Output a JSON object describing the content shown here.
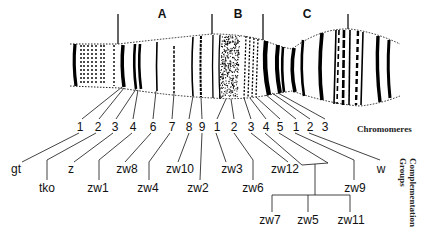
{
  "figure": {
    "regions": [
      {
        "label": "A",
        "x": 162,
        "y": 10
      },
      {
        "label": "B",
        "x": 238,
        "y": 10
      },
      {
        "label": "C",
        "x": 307,
        "y": 10
      }
    ],
    "region_boundaries_x": [
      118,
      212,
      263,
      348
    ],
    "chromomeres_label": "Chromomeres",
    "complementation_label": "Complementation Groups",
    "complementation_label_lines": [
      "Complementation",
      "Groups"
    ],
    "chromomeres": [
      {
        "label": "1",
        "x": 80,
        "region": "A"
      },
      {
        "label": "2",
        "x": 98,
        "region": "A"
      },
      {
        "label": "3",
        "x": 115,
        "region": "A"
      },
      {
        "label": "4",
        "x": 133,
        "region": "A"
      },
      {
        "label": "6",
        "x": 153,
        "region": "A"
      },
      {
        "label": "7",
        "x": 172,
        "region": "A"
      },
      {
        "label": "8",
        "x": 189,
        "region": "A"
      },
      {
        "label": "9",
        "x": 202,
        "region": "A"
      },
      {
        "label": "1",
        "x": 217,
        "region": "B"
      },
      {
        "label": "2",
        "x": 234,
        "region": "B"
      },
      {
        "label": "3",
        "x": 251,
        "region": "B"
      },
      {
        "label": "4",
        "x": 266,
        "region": "B"
      },
      {
        "label": "5",
        "x": 280,
        "region": "B"
      },
      {
        "label": "1",
        "x": 296,
        "region": "C"
      },
      {
        "label": "2",
        "x": 310,
        "region": "C"
      },
      {
        "label": "3",
        "x": 325,
        "region": "C"
      }
    ],
    "genes_row1": [
      {
        "label": "gt",
        "x": 16
      },
      {
        "label": "z",
        "x": 71
      },
      {
        "label": "zw8",
        "x": 127
      },
      {
        "label": "zw10",
        "x": 180
      },
      {
        "label": "zw3",
        "x": 232
      },
      {
        "label": "zw12",
        "x": 285
      },
      {
        "label": "w",
        "x": 381
      }
    ],
    "genes_row2": [
      {
        "label": "tko",
        "x": 47
      },
      {
        "label": "zw1",
        "x": 98
      },
      {
        "label": "zw4",
        "x": 148
      },
      {
        "label": "zw2",
        "x": 198
      },
      {
        "label": "zw6",
        "x": 253
      },
      {
        "label": "zw9",
        "x": 355
      }
    ],
    "genes_row3": [
      {
        "label": "zw7",
        "x": 270
      },
      {
        "label": "zw5",
        "x": 308
      },
      {
        "label": "zw11",
        "x": 351
      }
    ]
  }
}
